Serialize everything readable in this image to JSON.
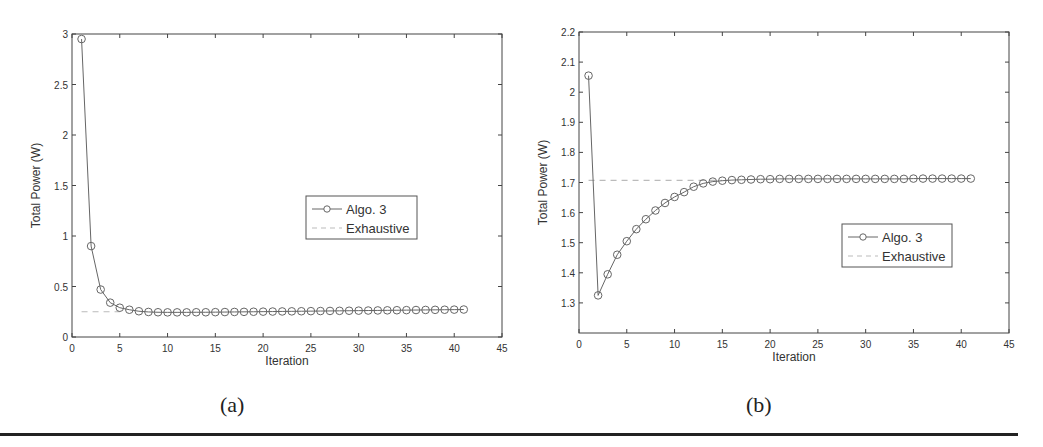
{
  "chart_data": [
    {
      "id": "a",
      "type": "line",
      "caption": "(a)",
      "title": "",
      "xlabel": "Iteration",
      "ylabel": "Total Power (W)",
      "xlim": [
        0,
        45
      ],
      "ylim": [
        0,
        3
      ],
      "xticks": [
        0,
        5,
        10,
        15,
        20,
        25,
        30,
        35,
        40,
        45
      ],
      "yticks": [
        0,
        0.5,
        1,
        1.5,
        2,
        2.5,
        3
      ],
      "ytick_labels": [
        "0",
        "0.5",
        "1",
        "1.5",
        "2",
        "2.5",
        "3"
      ],
      "grid": false,
      "legend_position": "center-right",
      "series": [
        {
          "name": "Algo. 3",
          "style": "solid-circle-markers",
          "color": "#666666",
          "x": [
            1,
            2,
            3,
            4,
            5,
            6,
            7,
            8,
            9,
            10,
            11,
            12,
            13,
            14,
            15,
            16,
            17,
            18,
            19,
            20,
            21,
            22,
            23,
            24,
            25,
            26,
            27,
            28,
            29,
            30,
            31,
            32,
            33,
            34,
            35,
            36,
            37,
            38,
            39,
            40,
            41
          ],
          "values": [
            2.95,
            0.9,
            0.47,
            0.34,
            0.29,
            0.27,
            0.255,
            0.248,
            0.245,
            0.244,
            0.244,
            0.244,
            0.245,
            0.245,
            0.246,
            0.247,
            0.248,
            0.249,
            0.25,
            0.251,
            0.252,
            0.253,
            0.254,
            0.255,
            0.256,
            0.257,
            0.258,
            0.259,
            0.26,
            0.261,
            0.262,
            0.263,
            0.264,
            0.265,
            0.266,
            0.267,
            0.268,
            0.269,
            0.27,
            0.271,
            0.272
          ]
        },
        {
          "name": "Exhaustive",
          "style": "dashed",
          "color": "#bbbbbb",
          "x": [
            1,
            5
          ],
          "values": [
            0.25,
            0.25
          ]
        }
      ]
    },
    {
      "id": "b",
      "type": "line",
      "caption": "(b)",
      "title": "",
      "xlabel": "Iteration",
      "ylabel": "Total Power (W)",
      "xlim": [
        0,
        45
      ],
      "ylim": [
        1.2,
        2.2
      ],
      "xticks": [
        0,
        5,
        10,
        15,
        20,
        25,
        30,
        35,
        40,
        45
      ],
      "yticks": [
        1.3,
        1.4,
        1.5,
        1.6,
        1.7,
        1.8,
        1.9,
        2.0,
        2.1,
        2.2
      ],
      "ytick_labels": [
        "1.3",
        "1.4",
        "1.5",
        "1.6",
        "1.7",
        "1.8",
        "1.9",
        "2",
        "2.1",
        "2.2"
      ],
      "grid": false,
      "legend_position": "lower-right",
      "series": [
        {
          "name": "Algo. 3",
          "style": "solid-circle-markers",
          "color": "#666666",
          "x": [
            1,
            2,
            3,
            4,
            5,
            6,
            7,
            8,
            9,
            10,
            11,
            12,
            13,
            14,
            15,
            16,
            17,
            18,
            19,
            20,
            21,
            22,
            23,
            24,
            25,
            26,
            27,
            28,
            29,
            30,
            31,
            32,
            33,
            34,
            35,
            36,
            37,
            38,
            39,
            40,
            41
          ],
          "values": [
            2.055,
            1.325,
            1.395,
            1.46,
            1.505,
            1.545,
            1.578,
            1.607,
            1.632,
            1.652,
            1.668,
            1.686,
            1.697,
            1.703,
            1.706,
            1.708,
            1.709,
            1.71,
            1.711,
            1.711,
            1.712,
            1.712,
            1.712,
            1.712,
            1.712,
            1.712,
            1.712,
            1.712,
            1.712,
            1.712,
            1.712,
            1.712,
            1.712,
            1.712,
            1.713,
            1.713,
            1.713,
            1.713,
            1.713,
            1.713,
            1.713
          ]
        },
        {
          "name": "Exhaustive",
          "style": "dashed",
          "color": "#bbbbbb",
          "x": [
            1,
            15
          ],
          "values": [
            1.707,
            1.707
          ]
        }
      ]
    }
  ],
  "layout": {
    "charts": [
      {
        "plot": {
          "x0": 72,
          "y0": 34,
          "x1": 502,
          "y1": 337
        },
        "legend": {
          "x": 306,
          "y": 196,
          "w": 111,
          "h": 43
        },
        "caption_pos": {
          "x": 236,
          "y": 400
        }
      },
      {
        "plot": {
          "x0": 579,
          "y0": 32,
          "x1": 1009,
          "y1": 333
        },
        "legend": {
          "x": 842,
          "y": 224,
          "w": 110,
          "h": 43
        },
        "caption_pos": {
          "x": 762,
          "y": 400
        }
      }
    ]
  }
}
